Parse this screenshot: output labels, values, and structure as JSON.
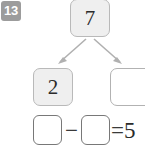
{
  "problem": {
    "number_label": "13",
    "badge_color": "#9c9c9c",
    "badge_text_color": "#ffffff"
  },
  "number_bond": {
    "whole": {
      "value": "7",
      "state": "filled",
      "fill_color": "#efefef",
      "border_color": "#b9b9b9"
    },
    "part_left": {
      "value": "2",
      "state": "filled",
      "fill_color": "#efefef",
      "border_color": "#b9b9b9"
    },
    "part_right": {
      "value": "",
      "state": "empty",
      "fill_color": "#ffffff",
      "border_color": "#b2b2b2"
    },
    "arrow_color": "#b0b0b0"
  },
  "equation": {
    "operand_1": "",
    "operator": "−",
    "operand_2": "",
    "equals": "=",
    "result": "5",
    "box_border_color": "#787878",
    "box_fill_color": "#ffffff"
  }
}
